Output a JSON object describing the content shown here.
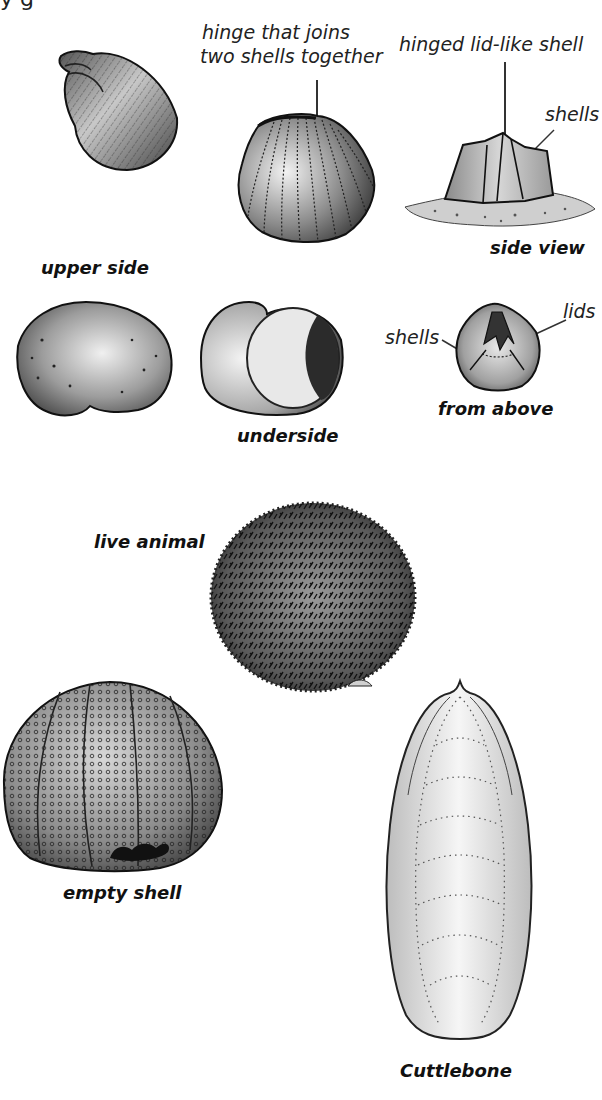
{
  "figure": {
    "top_fragment": "y     g",
    "specimens": [
      {
        "id": "winkle-shell",
        "caption": ""
      },
      {
        "id": "cockle-shell",
        "callout": "hinge that joins two shells together",
        "callout_lines": [
          "hinge that joins",
          "two shells together"
        ]
      },
      {
        "id": "barnacle-side",
        "callouts": [
          "hinged lid-like shell",
          "shells"
        ],
        "caption": "side view"
      },
      {
        "id": "topshell-upper",
        "caption": "upper side"
      },
      {
        "id": "topshell-under",
        "caption": "underside"
      },
      {
        "id": "barnacle-top",
        "callouts": [
          "shells",
          "lids"
        ],
        "caption": "from above"
      },
      {
        "id": "sea-urchin-live",
        "caption": "live animal"
      },
      {
        "id": "sea-urchin-test",
        "caption": "empty shell"
      },
      {
        "id": "cuttlebone",
        "caption": "Cuttlebone"
      }
    ]
  },
  "labels": {
    "hinge_line1": "hinge that joins",
    "hinge_line2": "two shells together",
    "hinged_lid": "hinged lid-like shell",
    "shells_side": "shells",
    "side_view": "side view",
    "upper_side": "upper side",
    "shells_top": "shells",
    "lids": "lids",
    "from_above": "from above",
    "underside": "underside",
    "live_animal": "live animal",
    "empty_shell": "empty shell",
    "cuttlebone": "Cuttlebone"
  },
  "colors": {
    "ink": "#1a1a1a",
    "shell_mid": "#9a9a9a",
    "shell_light": "#e4e4e4",
    "background": "#ffffff"
  }
}
